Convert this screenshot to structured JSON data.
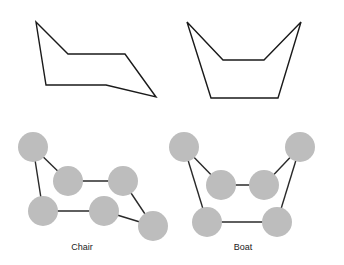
{
  "colors": {
    "outline": "#1a1a1a",
    "bond": "#2a2a2a",
    "atom": "#bdbdbd",
    "background": "#ffffff"
  },
  "diagrams": [
    {
      "name": "Chair",
      "label": "Chair",
      "label_position": {
        "x": 82,
        "y": 242
      },
      "outline_points": [
        [
          36,
          22
        ],
        [
          68,
          54
        ],
        [
          125,
          54
        ],
        [
          156,
          97
        ],
        [
          106,
          85
        ],
        [
          46,
          85
        ]
      ],
      "atoms": [
        {
          "id": "c1",
          "x": 33,
          "y": 147
        },
        {
          "id": "c2",
          "x": 68,
          "y": 181
        },
        {
          "id": "c3",
          "x": 123,
          "y": 181
        },
        {
          "id": "c4",
          "x": 43,
          "y": 211
        },
        {
          "id": "c5",
          "x": 104,
          "y": 211
        },
        {
          "id": "c6",
          "x": 153,
          "y": 226
        }
      ],
      "bonds": [
        [
          "c1",
          "c2"
        ],
        [
          "c1",
          "c4"
        ],
        [
          "c2",
          "c3"
        ],
        [
          "c3",
          "c6"
        ],
        [
          "c4",
          "c5"
        ],
        [
          "c5",
          "c6"
        ]
      ]
    },
    {
      "name": "Boat",
      "label": "Boat",
      "label_position": {
        "x": 243,
        "y": 242
      },
      "outline_points": [
        [
          187,
          22
        ],
        [
          223,
          60
        ],
        [
          264,
          60
        ],
        [
          301,
          22
        ],
        [
          278,
          98
        ],
        [
          211,
          98
        ]
      ],
      "atoms": [
        {
          "id": "b1",
          "x": 184,
          "y": 147
        },
        {
          "id": "b2",
          "x": 221,
          "y": 185
        },
        {
          "id": "b3",
          "x": 264,
          "y": 185
        },
        {
          "id": "b4",
          "x": 300,
          "y": 147
        },
        {
          "id": "b5",
          "x": 207,
          "y": 222
        },
        {
          "id": "b6",
          "x": 277,
          "y": 222
        }
      ],
      "bonds": [
        [
          "b1",
          "b2"
        ],
        [
          "b1",
          "b5"
        ],
        [
          "b2",
          "b3"
        ],
        [
          "b3",
          "b4"
        ],
        [
          "b4",
          "b6"
        ],
        [
          "b5",
          "b6"
        ]
      ]
    }
  ],
  "atom_radius": 15
}
